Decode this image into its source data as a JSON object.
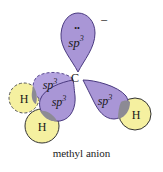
{
  "diagram": {
    "title": "methyl anion",
    "charge": "−",
    "lone_pair": "••",
    "central_atom": "C",
    "orbital_label": "sp",
    "orbital_superscript": "3",
    "hydrogen_label": "H",
    "orbitals": [
      {
        "id": "lone-pair-lobe",
        "label": "sp3",
        "holds": "lone pair"
      },
      {
        "id": "back-left-lobe",
        "label": "sp3",
        "bonded_to": "H (behind plane, dashed)"
      },
      {
        "id": "front-left-lobe",
        "label": "sp3",
        "bonded_to": "H (front)"
      },
      {
        "id": "right-lobe",
        "label": "sp3",
        "bonded_to": "H (right)"
      }
    ],
    "colors": {
      "orbital_fill": "#a996d6",
      "orbital_stroke": "#4a3a80",
      "hydrogen_fill": "#f5f0a0",
      "hydrogen_stroke": "#3a3a3a",
      "overlap_fill": "#8c8a94"
    }
  }
}
